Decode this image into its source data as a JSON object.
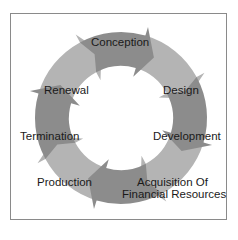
{
  "diagram": {
    "type": "cycle",
    "direction": "clockwise",
    "colors": {
      "dark": "#8c8c8c",
      "light": "#b4b4b4",
      "border": "#8a8a8a",
      "text": "#1a1a1a"
    },
    "stages": [
      {
        "label": "Conception",
        "shade": "dark"
      },
      {
        "label": "Design",
        "shade": "light"
      },
      {
        "label": "Development",
        "shade": "dark"
      },
      {
        "label": "Acquisition Of",
        "label2": "Financial Resources",
        "shade": "light"
      },
      {
        "label": "Production",
        "shade": "dark"
      },
      {
        "label": "Termination",
        "shade": "light"
      },
      {
        "label": "Renewal",
        "shade": "dark"
      },
      {
        "label": "",
        "shade": "light"
      }
    ]
  }
}
